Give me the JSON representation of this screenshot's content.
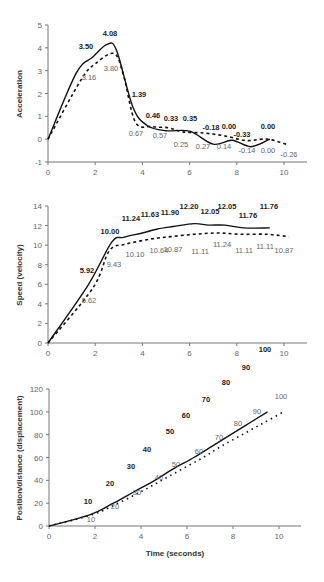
{
  "chart_data": [
    {
      "type": "line",
      "title": "",
      "xlabel": "",
      "ylabel": "Acceleration",
      "xlim": [
        0,
        11
      ],
      "ylim": [
        -1,
        5
      ],
      "x_ticks": [
        "0",
        "2",
        "4",
        "6",
        "8",
        "10"
      ],
      "y_ticks": [
        "-1",
        "0",
        "1",
        "2",
        "3",
        "4",
        "5"
      ],
      "grid": false,
      "series": [
        {
          "name": "solid",
          "style": "solid",
          "points": [
            [
              0,
              0
            ],
            [
              1.2,
              2.9
            ],
            [
              1.9,
              3.6
            ],
            [
              2.5,
              4.15
            ],
            [
              2.9,
              3.9
            ],
            [
              3.6,
              1.4
            ],
            [
              4.2,
              0.6
            ],
            [
              5.0,
              0.37
            ],
            [
              6.0,
              0.35
            ],
            [
              7.0,
              -0.22
            ],
            [
              7.8,
              -0.05
            ],
            [
              8.6,
              -0.33
            ],
            [
              9.4,
              0.0
            ]
          ],
          "labels": [
            "3.50",
            "4.08",
            "1.39",
            "0.46",
            "0.33",
            "0.35",
            "-0.18",
            "0.00",
            "-0.33",
            "0.00"
          ]
        },
        {
          "name": "dashed",
          "style": "dashed",
          "points": [
            [
              0,
              0
            ],
            [
              1.4,
              2.6
            ],
            [
              2.0,
              3.3
            ],
            [
              2.8,
              3.75
            ],
            [
              3.2,
              2.8
            ],
            [
              3.7,
              0.75
            ],
            [
              4.4,
              0.55
            ],
            [
              5.1,
              0.5
            ],
            [
              5.7,
              0.32
            ],
            [
              6.6,
              0.27
            ],
            [
              7.5,
              0.14
            ],
            [
              8.4,
              -0.06
            ],
            [
              9.3,
              0.0
            ],
            [
              10.2,
              -0.26
            ]
          ],
          "labels": [
            "3.16",
            "3.80",
            "0.67",
            "0.57",
            "0.25",
            "0.27",
            "0.14",
            "-0.14",
            "0.00",
            "-0.26"
          ]
        }
      ]
    },
    {
      "type": "line",
      "title": "",
      "xlabel": "",
      "ylabel": "Speed (velocity)",
      "xlim": [
        0,
        11
      ],
      "ylim": [
        0,
        14
      ],
      "x_ticks": [
        "0",
        "2",
        "4",
        "6",
        "8",
        "10"
      ],
      "y_ticks": [
        "0",
        "2",
        "4",
        "6",
        "8",
        "10",
        "12",
        "14"
      ],
      "grid": false,
      "series": [
        {
          "name": "solid",
          "style": "solid",
          "points": [
            [
              0,
              0
            ],
            [
              1.7,
              5.92
            ],
            [
              2.7,
              10.3
            ],
            [
              3.2,
              10.8
            ],
            [
              4.0,
              11.24
            ],
            [
              4.6,
              11.63
            ],
            [
              5.3,
              11.9
            ],
            [
              6.2,
              12.2
            ],
            [
              6.8,
              12.05
            ],
            [
              7.5,
              12.05
            ],
            [
              8.3,
              11.76
            ],
            [
              9.4,
              11.76
            ]
          ],
          "labels": [
            "5.92",
            "10.00",
            "11.24",
            "11.63",
            "11.90",
            "12.20",
            "12.05",
            "12.05",
            "11.76",
            "11.76"
          ]
        },
        {
          "name": "dashed",
          "style": "dashed",
          "points": [
            [
              0,
              0
            ],
            [
              1.9,
              5.62
            ],
            [
              2.6,
              9.43
            ],
            [
              3.3,
              10.1
            ],
            [
              4.4,
              10.64
            ],
            [
              5.2,
              10.87
            ],
            [
              6.2,
              11.11
            ],
            [
              7.2,
              11.24
            ],
            [
              8.2,
              11.11
            ],
            [
              9.3,
              11.11
            ],
            [
              10.2,
              10.87
            ]
          ],
          "labels": [
            "5.62",
            "9.43",
            "10.10",
            "10.64",
            "10.87",
            "11.11",
            "11.24",
            "11.11",
            "11.11",
            "10.87"
          ]
        }
      ]
    },
    {
      "type": "line",
      "title": "",
      "xlabel": "Time (seconds)",
      "ylabel": "Position/distance (displacement)",
      "xlim": [
        0,
        11
      ],
      "ylim": [
        0,
        120
      ],
      "x_ticks": [
        "0",
        "2",
        "4",
        "6",
        "8",
        "10"
      ],
      "y_ticks": [
        "0",
        "20",
        "40",
        "60",
        "80",
        "100",
        "120"
      ],
      "grid": false,
      "series": [
        {
          "name": "solid",
          "style": "solid",
          "points": [
            [
              0,
              0
            ],
            [
              1.8,
              10
            ],
            [
              2.8,
              20
            ],
            [
              3.7,
              30
            ],
            [
              4.6,
              40
            ],
            [
              5.4,
              50
            ],
            [
              6.3,
              60
            ],
            [
              7.1,
              70
            ],
            [
              7.9,
              80
            ],
            [
              8.7,
              90
            ],
            [
              9.5,
              100
            ]
          ],
          "labels": [
            "10",
            "20",
            "30",
            "40",
            "50",
            "60",
            "70",
            "80",
            "90",
            "100"
          ]
        },
        {
          "name": "dashed",
          "style": "dotted",
          "points": [
            [
              0,
              0
            ],
            [
              1.9,
              10
            ],
            [
              3.0,
              20
            ],
            [
              4.0,
              30
            ],
            [
              4.9,
              40
            ],
            [
              5.8,
              50
            ],
            [
              6.7,
              60
            ],
            [
              7.5,
              70
            ],
            [
              8.4,
              80
            ],
            [
              9.3,
              90
            ],
            [
              10.2,
              100
            ]
          ],
          "labels": [
            "10",
            "20",
            "30",
            "40",
            "50",
            "60",
            "70",
            "80",
            "90",
            "100"
          ]
        }
      ]
    }
  ],
  "texts": {
    "acc_ylabel": "Acceleration",
    "speed_ylabel": "Speed (velocity)",
    "pos_ylabel": "Position/distance (displacement)",
    "xlabel": "Time (seconds)"
  }
}
